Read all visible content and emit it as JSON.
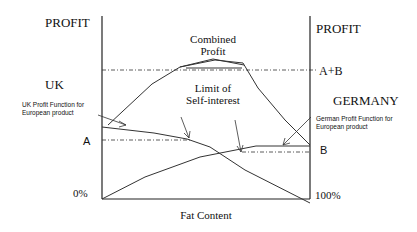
{
  "labels": {
    "left_axis_title": "PROFIT",
    "right_axis_title": "PROFIT",
    "left_country": "UK",
    "right_country": "GERMANY",
    "combined_profit_line1": "Combined",
    "combined_profit_line2": "Profit",
    "limit_line1": "Limit of",
    "limit_line2": "Self-interest",
    "uk_function_line1": "UK Profit Function for",
    "uk_function_line2": "European product",
    "german_function_line1": "German Profit Function for",
    "german_function_line2": "European product",
    "level_a": "A",
    "level_b": "B",
    "level_ab": "A+B",
    "x_min": "0%",
    "x_max": "100%",
    "x_axis_title": "Fat Content"
  },
  "colors": {
    "line": "#333333",
    "text": "#111111",
    "background": "#ffffff"
  }
}
